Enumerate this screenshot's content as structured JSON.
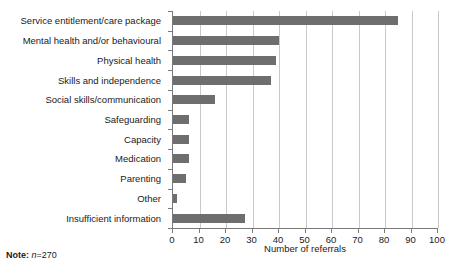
{
  "chart_data": {
    "type": "bar",
    "orientation": "horizontal",
    "title": "",
    "subtitle": "",
    "xlabel": "Number of referrals",
    "ylabel": "",
    "xlim": [
      0,
      100
    ],
    "xticks": [
      0,
      10,
      20,
      30,
      40,
      50,
      60,
      70,
      80,
      90,
      100
    ],
    "xtick_labels": [
      "0",
      "10",
      "20",
      "30",
      "40",
      "50",
      "60",
      "70",
      "80",
      "90",
      "100"
    ],
    "grid": "vertical",
    "legend": "none",
    "bar_color": "#6e6e6e",
    "axis_color": "#7a7a7a",
    "gridline_color": "#c9c9c9",
    "categories": [
      "Service entitlement/care package",
      "Mental health and/or behavioural",
      "Physical health",
      "Skills and independence",
      "Social skills/communication",
      "Safeguarding",
      "Capacity",
      "Medication",
      "Parenting",
      "Other",
      "Insufficient information"
    ],
    "values": [
      85,
      40,
      39,
      37,
      16,
      6,
      6,
      6,
      5,
      1.5,
      27
    ],
    "annotations": []
  },
  "note": {
    "key": "Note:",
    "n_symbol": "n",
    "n_value": "=270"
  }
}
